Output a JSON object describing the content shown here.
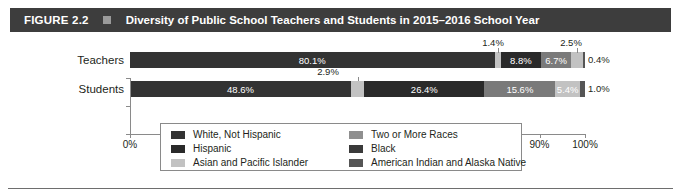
{
  "header": {
    "figure_number": "FIGURE 2.2",
    "separator_icon": "square-glyph",
    "title": "Diversity of Public School Teachers and Students in 2015–2016 School Year",
    "bar_color": "#3d3d3d",
    "text_color": "#ffffff"
  },
  "chart_data": {
    "type": "bar",
    "orientation": "horizontal",
    "stacked": true,
    "normalized_percent": true,
    "title": "Diversity of Public School Teachers and Students in 2015–2016 School Year",
    "xlabel": "",
    "ylabel": "",
    "xlim": [
      0,
      100
    ],
    "xticks": [
      0,
      10,
      20,
      30,
      40,
      50,
      60,
      70,
      80,
      90,
      100
    ],
    "xtick_labels": [
      "0%",
      "10%",
      "20%",
      "30%",
      "40%",
      "50%",
      "60%",
      "70%",
      "80%",
      "90%",
      "100%"
    ],
    "grid": false,
    "legend_position": "bottom",
    "categories": [
      "Teachers",
      "Students"
    ],
    "series": [
      {
        "name": "White, Not Hispanic",
        "color": "#333333",
        "values": [
          80.1,
          48.6
        ]
      },
      {
        "name": "Two or More Races",
        "color": "#b9b9b9",
        "values": [
          1.4,
          2.9
        ]
      },
      {
        "name": "Hispanic",
        "color": "#2a2a2a",
        "values": [
          8.8,
          26.4
        ]
      },
      {
        "name": "Black",
        "color": "#666666",
        "values": [
          6.7,
          15.6
        ]
      },
      {
        "name": "Asian and Pacific Islander",
        "color": "#c2c2c2",
        "values": [
          2.5,
          5.4
        ]
      },
      {
        "name": "American Indian and Alaska Native",
        "color": "#555555",
        "values": [
          0.4,
          1.0
        ]
      }
    ],
    "data_labels": {
      "teachers": [
        "80.1%",
        "1.4%",
        "8.8%",
        "6.7%",
        "2.5%",
        "0.4%"
      ],
      "students": [
        "48.6%",
        "2.9%",
        "26.4%",
        "15.6%",
        "5.4%",
        "1.0%"
      ]
    }
  },
  "rows": {
    "teachers": {
      "label": "Teachers",
      "segments": [
        {
          "label": "80.1%",
          "value": 80.1,
          "style": "dark",
          "label_inside": true
        },
        {
          "label": "1.4%",
          "value": 1.4,
          "style": "light",
          "label_inside": false,
          "callout": true
        },
        {
          "label": "8.8%",
          "value": 8.8,
          "style": "black",
          "label_inside": true
        },
        {
          "label": "6.7%",
          "value": 6.7,
          "style": "mid",
          "label_inside": true
        },
        {
          "label": "2.5%",
          "value": 2.5,
          "style": "light",
          "label_inside": false,
          "callout": true
        },
        {
          "label": "0.4%",
          "value": 0.4,
          "style": "mdark",
          "label_inside": false,
          "outside": true
        }
      ]
    },
    "students": {
      "label": "Students",
      "segments": [
        {
          "label": "48.6%",
          "value": 48.6,
          "style": "dark",
          "label_inside": true
        },
        {
          "label": "2.9%",
          "value": 2.9,
          "style": "light",
          "label_inside": false,
          "callout": true
        },
        {
          "label": "26.4%",
          "value": 26.4,
          "style": "black",
          "label_inside": true
        },
        {
          "label": "15.6%",
          "value": 15.6,
          "style": "mid",
          "label_inside": true
        },
        {
          "label": "5.4%",
          "value": 5.4,
          "style": "light",
          "label_inside": true
        },
        {
          "label": "1.0%",
          "value": 1.0,
          "style": "mdark",
          "label_inside": false,
          "outside": true
        }
      ]
    }
  },
  "legend": {
    "left_column": [
      {
        "label": "White, Not Hispanic",
        "color": "#333333"
      },
      {
        "label": "Hispanic",
        "color": "#2a2a2a"
      },
      {
        "label": "Asian and Pacific Islander",
        "color": "#c2c2c2"
      }
    ],
    "right_column": [
      {
        "label": "Two or More Races",
        "color": "#8f8f8f"
      },
      {
        "label": "Black",
        "color": "#3a3a3a"
      },
      {
        "label": "American Indian and Alaska Native",
        "color": "#555555"
      }
    ]
  }
}
